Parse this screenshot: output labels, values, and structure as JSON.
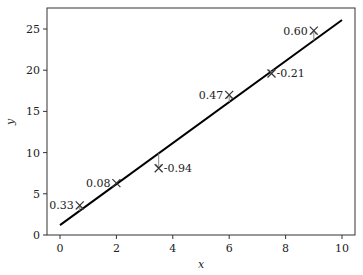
{
  "chart_data": {
    "type": "scatter",
    "title": "",
    "xlabel": "x",
    "ylabel": "y",
    "xlim": [
      -0.5,
      10.4
    ],
    "ylim": [
      -0.5,
      27.4
    ],
    "xticks": [
      0,
      2,
      4,
      6,
      8,
      10
    ],
    "yticks": [
      0,
      5,
      10,
      15,
      20,
      25
    ],
    "grid": false,
    "legend": null,
    "points": [
      {
        "x": 0.7,
        "y": 3.6,
        "label": "0.33",
        "label_side": "left"
      },
      {
        "x": 2.0,
        "y": 6.3,
        "label": "0.08",
        "label_side": "left"
      },
      {
        "x": 3.5,
        "y": 8.1,
        "label": "-0.94",
        "label_side": "right"
      },
      {
        "x": 6.0,
        "y": 17.0,
        "label": "0.47",
        "label_side": "left"
      },
      {
        "x": 7.5,
        "y": 19.6,
        "label": "-0.21",
        "label_side": "right"
      },
      {
        "x": 9.0,
        "y": 24.8,
        "label": "0.60",
        "label_side": "left"
      }
    ],
    "fit_line": {
      "x0": 0,
      "y0": 1.2,
      "x1": 10,
      "y1": 26.1
    },
    "marker": "x",
    "residual_arrows": true
  }
}
